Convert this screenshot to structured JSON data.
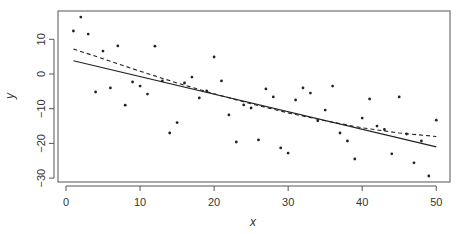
{
  "chart_data": {
    "type": "scatter",
    "title": "",
    "xlabel": "x",
    "ylabel": "y",
    "xlim": [
      -1,
      52
    ],
    "ylim": [
      -31,
      18
    ],
    "grid": false,
    "legend": null,
    "x_ticks": [
      0,
      10,
      20,
      30,
      40,
      50
    ],
    "y_ticks": [
      -30,
      -20,
      -10,
      0,
      10
    ],
    "x_tick_labels": [
      "0",
      "10",
      "20",
      "30",
      "40",
      "50"
    ],
    "y_tick_labels": [
      "−30",
      "−20",
      "−10",
      "0",
      "10"
    ],
    "series": [
      {
        "name": "observations",
        "kind": "points",
        "x": [
          1,
          2,
          3,
          4,
          5,
          6,
          7,
          8,
          9,
          10,
          11,
          12,
          13,
          14,
          15,
          16,
          17,
          18,
          19,
          20,
          21,
          22,
          23,
          24,
          25,
          26,
          27,
          28,
          29,
          30,
          31,
          32,
          33,
          34,
          35,
          36,
          37,
          38,
          39,
          40,
          41,
          42,
          43,
          44,
          45,
          46,
          47,
          48,
          49,
          50
        ],
        "y": [
          12.4,
          16.4,
          11.5,
          -5.2,
          6.6,
          -4.0,
          8.1,
          -9.0,
          -2.3,
          -3.5,
          -5.8,
          8.0,
          -2.0,
          -17.0,
          -14.0,
          -2.6,
          -0.9,
          -6.9,
          -4.9,
          4.9,
          -2.0,
          -11.8,
          -19.6,
          -8.9,
          -9.8,
          -19.0,
          -4.3,
          -6.6,
          -21.3,
          -22.8,
          -7.5,
          -4.0,
          -5.5,
          -13.5,
          -10.4,
          -3.5,
          -17.0,
          -19.3,
          -24.5,
          -12.7,
          -7.2,
          -15.0,
          -16.0,
          -23.0,
          -6.6,
          -17.3,
          -25.6,
          -19.3,
          -29.4,
          -13.3
        ]
      },
      {
        "name": "linear fit",
        "kind": "line",
        "style": "solid",
        "x": [
          1,
          50
        ],
        "y": [
          3.8,
          -21.0
        ]
      },
      {
        "name": "quadratic fit",
        "kind": "line",
        "style": "dashed",
        "x": [
          1,
          5,
          10,
          15,
          20,
          25,
          30,
          35,
          40,
          45,
          50
        ],
        "y": [
          7.2,
          4.4,
          0.8,
          -2.6,
          -5.7,
          -8.6,
          -11.2,
          -13.5,
          -15.5,
          -17.0,
          -18.0
        ]
      }
    ]
  },
  "colors": {
    "points": "#222222",
    "lines": "#222222",
    "axes": "#555555",
    "background": "#ffffff"
  }
}
